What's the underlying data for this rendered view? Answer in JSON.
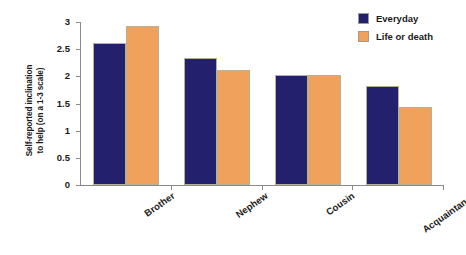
{
  "chart_data": {
    "type": "bar",
    "title": "",
    "xlabel": "",
    "ylabel": "Self-reported inclination to help (on a 1-3 scale)",
    "ylabel_line1": "Self-reported inclination",
    "ylabel_line2": "to help (on a 1-3 scale)",
    "categories": [
      "Brother",
      "Nephew",
      "Cousin",
      "Acquaintance"
    ],
    "series": [
      {
        "name": "Everyday",
        "color": "#23206e",
        "values": [
          2.61,
          2.33,
          2.03,
          1.82
        ]
      },
      {
        "name": "Life or death",
        "color": "#f0a15c",
        "values": [
          2.92,
          2.11,
          2.03,
          1.44
        ]
      }
    ],
    "ylim": [
      0,
      3
    ],
    "yticks": [
      "0",
      "0.5",
      "1",
      "1.5",
      "2",
      "2.5",
      "3"
    ],
    "ytick_values": [
      0,
      0.5,
      1,
      1.5,
      2,
      2.5,
      3
    ],
    "grid": false,
    "legend_position": "top-right"
  },
  "legend": {
    "items": [
      {
        "label": "Everyday",
        "swatch_name": "legend-swatch-everyday"
      },
      {
        "label": "Life or death",
        "swatch_name": "legend-swatch-life-or-death"
      }
    ]
  },
  "colors": {
    "series_everyday": "#23206e",
    "series_life_or_death": "#f0a15c",
    "axis": "#8a8a8a",
    "text": "#1a1a1a",
    "background": "#ffffff"
  }
}
